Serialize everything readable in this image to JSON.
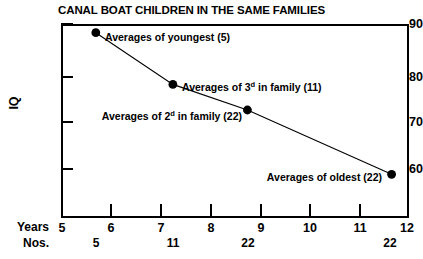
{
  "chart_data": {
    "type": "line",
    "title": "CANAL BOAT CHILDREN IN THE SAME FAMILIES",
    "xlabel": "Years",
    "ylabel": "IQ",
    "xlim": [
      5,
      12
    ],
    "ylim": [
      55,
      90
    ],
    "grid": false,
    "legend": "none",
    "x_ticks": [
      "5",
      "6",
      "7",
      "8",
      "9",
      "10",
      "11",
      "12"
    ],
    "x_tick_values": [
      5,
      6,
      7,
      8,
      9,
      10,
      11,
      12
    ],
    "y_ticks": [
      "90",
      "80",
      "70",
      "60"
    ],
    "y_tick_values": [
      90,
      80,
      70,
      60
    ],
    "row_labels": {
      "years": "Years",
      "nos": "Nos."
    },
    "nos_values": [
      "5",
      "11",
      "22",
      "22"
    ],
    "series": [
      {
        "name": "Canal boat children average IQ by birth order",
        "x": [
          5.7,
          7.25,
          8.75,
          11.65
        ],
        "values": [
          88.0,
          77.3,
          72.0,
          58.7
        ],
        "counts": [
          5,
          11,
          22,
          22
        ],
        "marker": "filled-circle",
        "color": "#000000"
      }
    ],
    "annotations": [
      {
        "text_prefix": "Averages of youngest",
        "ordinal": "",
        "text_suffix": " (5)",
        "full_text": "Averages of youngest (5)",
        "point_index": 0,
        "align": "left"
      },
      {
        "text_prefix": "Averages of 3",
        "ordinal": "d",
        "text_suffix": " in family (11)",
        "full_text": "Averages of 3d in family (11)",
        "point_index": 1,
        "align": "left"
      },
      {
        "text_prefix": "Averages of 2",
        "ordinal": "d",
        "text_suffix": " in family (22)",
        "full_text": "Averages of 2d in family (22)",
        "point_index": 2,
        "align": "right"
      },
      {
        "text_prefix": "Averages of oldest",
        "ordinal": "",
        "text_suffix": " (22)",
        "full_text": "Averages of oldest (22)",
        "point_index": 3,
        "align": "right"
      }
    ]
  }
}
